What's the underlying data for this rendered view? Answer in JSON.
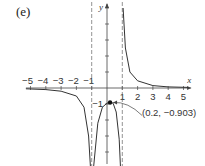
{
  "panel_label": "(e)",
  "chart_data": {
    "type": "line",
    "title": "",
    "xlabel": "x",
    "ylabel": "y",
    "xlim": [
      -5.3,
      5.5
    ],
    "ylim": [
      -5,
      5
    ],
    "x_ticks": [
      -5,
      -4,
      -3,
      -2,
      -1,
      1,
      2,
      3,
      4,
      5
    ],
    "x_tick_labels": [
      "−5",
      "−4",
      "−3",
      "−2",
      "−1",
      "1",
      "2",
      "3",
      "4",
      "5"
    ],
    "y_ticks": [
      -1
    ],
    "y_tick_labels": [
      "−1"
    ],
    "vertical_asymptotes": [
      -1,
      1
    ],
    "horizontal_asymptote": 0,
    "grid": false,
    "annotation": {
      "x": 0.2,
      "y": -0.903,
      "text": "(0.2, −0.903)"
    },
    "series": [
      {
        "name": "left branch",
        "x": [
          -5.3,
          -4,
          -3,
          -2,
          -1.5,
          -1.2,
          -1.08
        ],
        "y": [
          -0.05,
          -0.1,
          -0.2,
          -0.5,
          -1.2,
          -3,
          -5
        ]
      },
      {
        "name": "middle branch",
        "x": [
          -0.88,
          -0.6,
          -0.3,
          0,
          0.2,
          0.4,
          0.6,
          0.8,
          0.88
        ],
        "y": [
          -5,
          -2.2,
          -1.2,
          -0.95,
          -0.903,
          -0.95,
          -1.5,
          -3.2,
          -5
        ]
      },
      {
        "name": "right branch",
        "x": [
          1.05,
          1.2,
          1.5,
          2,
          3,
          4,
          5.3
        ],
        "y": [
          5,
          2.5,
          1.0,
          0.45,
          0.15,
          0.07,
          0.04
        ]
      }
    ]
  }
}
